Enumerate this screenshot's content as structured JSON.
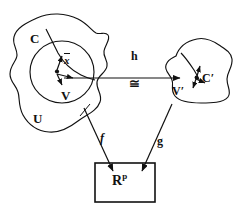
{
  "diagram": {
    "type": "mathematical-diagram",
    "background_color": "#ffffff",
    "stroke_color": "#111111",
    "labels": {
      "curve_C": "C",
      "region_U": "U",
      "neighborhood_V": "V",
      "map_h": "h",
      "congruence": "≅",
      "neighborhood_V_prime": "V′",
      "curve_C_prime": "C′",
      "map_f": "f",
      "map_g": "g",
      "euclidean_space_base": "R",
      "euclidean_space_exponent": "p",
      "point_x_bar": "x"
    },
    "shapes": {
      "outer_blob_name": "U",
      "inner_circle_name": "V",
      "right_blob_name": "V′",
      "target_box_name": "R^p"
    },
    "arrows": [
      {
        "name": "h",
        "from": "V",
        "to": "V′",
        "label": "h",
        "sublabel": "≅"
      },
      {
        "name": "f",
        "from": "U",
        "to": "R^p",
        "label": "f"
      },
      {
        "name": "g",
        "from": "V′",
        "to": "R^p",
        "label": "g"
      }
    ]
  }
}
